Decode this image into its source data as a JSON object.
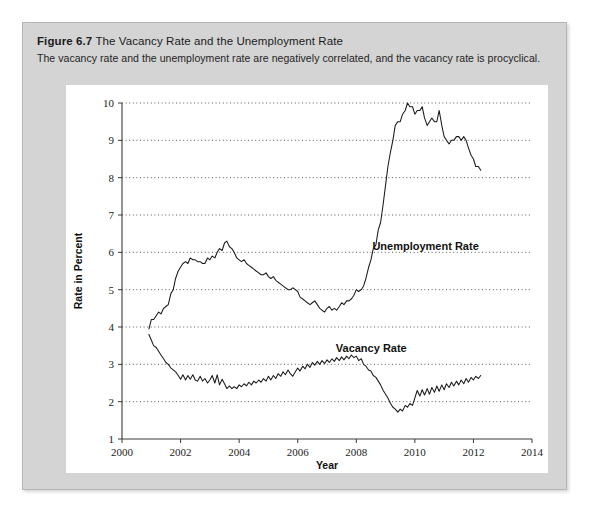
{
  "figure": {
    "number_label": "Figure 6.7",
    "title": "The Vacancy Rate and the Unemployment Rate",
    "subtitle": "The vacancy rate and the unemployment rate are negatively correlated, and the vacancy rate is procyclical.",
    "card_color": "#d4d4d4",
    "panel_color": "#ffffff",
    "line_color": "#1a1a1a"
  },
  "chart_data": {
    "type": "line",
    "title": "The Vacancy Rate and the Unemployment Rate",
    "xlabel": "Year",
    "ylabel": "Rate in Percent",
    "xlim": [
      2000,
      2014
    ],
    "ylim": [
      1,
      10
    ],
    "xticks": [
      2000,
      2002,
      2004,
      2006,
      2008,
      2010,
      2012,
      2014
    ],
    "yticks": [
      1,
      2,
      3,
      4,
      5,
      6,
      7,
      8,
      9,
      10
    ],
    "grid": true,
    "legend_position": "inline-annotation",
    "series": [
      {
        "name": "Unemployment Rate",
        "label_x": 2008.55,
        "label_y": 6.05,
        "x": [
          2000.92,
          2001.0,
          2001.08,
          2001.17,
          2001.25,
          2001.33,
          2001.42,
          2001.5,
          2001.58,
          2001.67,
          2001.75,
          2001.83,
          2001.92,
          2002.0,
          2002.08,
          2002.17,
          2002.25,
          2002.33,
          2002.42,
          2002.5,
          2002.58,
          2002.67,
          2002.75,
          2002.83,
          2002.92,
          2003.0,
          2003.08,
          2003.17,
          2003.25,
          2003.33,
          2003.42,
          2003.5,
          2003.58,
          2003.67,
          2003.75,
          2003.83,
          2003.92,
          2004.0,
          2004.08,
          2004.17,
          2004.25,
          2004.33,
          2004.42,
          2004.5,
          2004.58,
          2004.67,
          2004.75,
          2004.83,
          2004.92,
          2005.0,
          2005.08,
          2005.17,
          2005.25,
          2005.33,
          2005.42,
          2005.5,
          2005.58,
          2005.67,
          2005.75,
          2005.83,
          2005.92,
          2006.0,
          2006.08,
          2006.17,
          2006.25,
          2006.33,
          2006.42,
          2006.5,
          2006.58,
          2006.67,
          2006.75,
          2006.83,
          2006.92,
          2007.0,
          2007.08,
          2007.17,
          2007.25,
          2007.33,
          2007.42,
          2007.5,
          2007.58,
          2007.67,
          2007.75,
          2007.83,
          2007.92,
          2008.0,
          2008.08,
          2008.17,
          2008.25,
          2008.33,
          2008.42,
          2008.5,
          2008.58,
          2008.67,
          2008.75,
          2008.83,
          2008.92,
          2009.0,
          2009.08,
          2009.17,
          2009.25,
          2009.33,
          2009.42,
          2009.5,
          2009.58,
          2009.67,
          2009.75,
          2009.83,
          2009.92,
          2010.0,
          2010.08,
          2010.17,
          2010.25,
          2010.33,
          2010.42,
          2010.5,
          2010.58,
          2010.67,
          2010.75,
          2010.83,
          2010.92,
          2011.0,
          2011.08,
          2011.17,
          2011.25,
          2011.33,
          2011.42,
          2011.5,
          2011.58,
          2011.67,
          2011.75,
          2011.83,
          2011.92,
          2012.0,
          2012.08,
          2012.17,
          2012.25
        ],
        "y": [
          3.95,
          4.2,
          4.2,
          4.3,
          4.4,
          4.35,
          4.5,
          4.55,
          4.6,
          4.9,
          5.0,
          5.3,
          5.5,
          5.6,
          5.7,
          5.75,
          5.7,
          5.85,
          5.8,
          5.8,
          5.75,
          5.75,
          5.7,
          5.7,
          5.85,
          5.8,
          5.9,
          5.85,
          6.0,
          6.1,
          6.05,
          6.25,
          6.3,
          6.15,
          6.1,
          6.0,
          5.85,
          5.8,
          5.75,
          5.8,
          5.7,
          5.65,
          5.6,
          5.55,
          5.5,
          5.45,
          5.4,
          5.4,
          5.45,
          5.35,
          5.3,
          5.35,
          5.25,
          5.2,
          5.15,
          5.1,
          5.05,
          5.0,
          5.0,
          5.05,
          5.0,
          4.95,
          4.8,
          4.75,
          4.7,
          4.65,
          4.6,
          4.65,
          4.7,
          4.6,
          4.5,
          4.45,
          4.4,
          4.5,
          4.55,
          4.45,
          4.5,
          4.45,
          4.55,
          4.65,
          4.6,
          4.7,
          4.7,
          4.75,
          4.85,
          5.0,
          4.95,
          5.0,
          5.1,
          5.3,
          5.6,
          5.8,
          6.1,
          6.2,
          6.6,
          6.8,
          7.3,
          7.8,
          8.3,
          8.7,
          9.0,
          9.4,
          9.5,
          9.5,
          9.7,
          9.8,
          10.0,
          9.9,
          9.9,
          9.7,
          9.8,
          9.8,
          9.9,
          9.6,
          9.4,
          9.5,
          9.6,
          9.5,
          9.5,
          9.8,
          9.4,
          9.1,
          9.0,
          8.9,
          9.0,
          9.0,
          9.1,
          9.1,
          9.0,
          9.1,
          9.0,
          8.8,
          8.6,
          8.5,
          8.3,
          8.3,
          8.2
        ]
      },
      {
        "name": "Vacancy Rate",
        "label_x": 2007.3,
        "label_y": 3.32,
        "x": [
          2000.92,
          2001.0,
          2001.08,
          2001.17,
          2001.25,
          2001.33,
          2001.42,
          2001.5,
          2001.58,
          2001.67,
          2001.75,
          2001.83,
          2001.92,
          2002.0,
          2002.08,
          2002.17,
          2002.25,
          2002.33,
          2002.42,
          2002.5,
          2002.58,
          2002.67,
          2002.75,
          2002.83,
          2002.92,
          2003.0,
          2003.08,
          2003.17,
          2003.25,
          2003.33,
          2003.42,
          2003.5,
          2003.58,
          2003.67,
          2003.75,
          2003.83,
          2003.92,
          2004.0,
          2004.08,
          2004.17,
          2004.25,
          2004.33,
          2004.42,
          2004.5,
          2004.58,
          2004.67,
          2004.75,
          2004.83,
          2004.92,
          2005.0,
          2005.08,
          2005.17,
          2005.25,
          2005.33,
          2005.42,
          2005.5,
          2005.58,
          2005.67,
          2005.75,
          2005.83,
          2005.92,
          2006.0,
          2006.08,
          2006.17,
          2006.25,
          2006.33,
          2006.42,
          2006.5,
          2006.58,
          2006.67,
          2006.75,
          2006.83,
          2006.92,
          2007.0,
          2007.08,
          2007.17,
          2007.25,
          2007.33,
          2007.42,
          2007.5,
          2007.58,
          2007.67,
          2007.75,
          2007.83,
          2007.92,
          2008.0,
          2008.08,
          2008.17,
          2008.25,
          2008.33,
          2008.42,
          2008.5,
          2008.58,
          2008.67,
          2008.75,
          2008.83,
          2008.92,
          2009.0,
          2009.08,
          2009.17,
          2009.25,
          2009.33,
          2009.42,
          2009.5,
          2009.58,
          2009.67,
          2009.75,
          2009.83,
          2009.92,
          2010.0,
          2010.08,
          2010.17,
          2010.25,
          2010.33,
          2010.42,
          2010.5,
          2010.58,
          2010.67,
          2010.75,
          2010.83,
          2010.92,
          2011.0,
          2011.08,
          2011.17,
          2011.25,
          2011.33,
          2011.42,
          2011.5,
          2011.58,
          2011.67,
          2011.75,
          2011.83,
          2011.92,
          2012.0,
          2012.08,
          2012.17,
          2012.25
        ],
        "y": [
          3.8,
          3.65,
          3.5,
          3.45,
          3.35,
          3.25,
          3.15,
          3.05,
          3.0,
          2.9,
          2.85,
          2.8,
          2.7,
          2.6,
          2.72,
          2.58,
          2.7,
          2.6,
          2.72,
          2.58,
          2.55,
          2.68,
          2.55,
          2.62,
          2.5,
          2.58,
          2.7,
          2.5,
          2.72,
          2.45,
          2.6,
          2.48,
          2.35,
          2.42,
          2.35,
          2.4,
          2.35,
          2.45,
          2.4,
          2.48,
          2.42,
          2.52,
          2.45,
          2.55,
          2.5,
          2.58,
          2.52,
          2.62,
          2.55,
          2.68,
          2.58,
          2.7,
          2.62,
          2.75,
          2.68,
          2.8,
          2.72,
          2.85,
          2.75,
          2.68,
          2.8,
          2.9,
          2.82,
          2.95,
          2.88,
          3.0,
          2.92,
          3.05,
          2.98,
          3.08,
          3.0,
          3.1,
          3.02,
          3.12,
          3.05,
          3.15,
          3.08,
          3.18,
          3.1,
          3.2,
          3.12,
          3.22,
          3.15,
          3.25,
          3.18,
          3.22,
          3.1,
          3.15,
          3.0,
          2.95,
          2.85,
          2.82,
          2.7,
          2.65,
          2.55,
          2.45,
          2.3,
          2.2,
          2.1,
          1.95,
          1.85,
          1.8,
          1.72,
          1.8,
          1.75,
          1.9,
          1.85,
          1.95,
          1.9,
          2.1,
          2.3,
          2.15,
          2.32,
          2.18,
          2.35,
          2.2,
          2.38,
          2.25,
          2.42,
          2.28,
          2.45,
          2.32,
          2.48,
          2.38,
          2.52,
          2.42,
          2.55,
          2.45,
          2.58,
          2.48,
          2.62,
          2.52,
          2.65,
          2.58,
          2.68,
          2.62,
          2.7
        ]
      }
    ]
  }
}
